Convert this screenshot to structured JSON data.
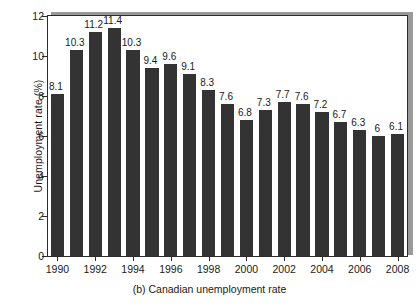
{
  "caption": "(b) Canadian unemployment rate",
  "axes": {
    "ylabel": "Unemployment rate (%)",
    "yticks": [
      "0",
      "2",
      "4",
      "6",
      "8",
      "10",
      "12"
    ],
    "xticks": [
      "1990",
      "1992",
      "1994",
      "1996",
      "1998",
      "2000",
      "2002",
      "2004",
      "2006",
      "2008"
    ]
  },
  "colors": {
    "bar": "#333333",
    "axis": "#2b2b2b",
    "shadow": "#9a9a9a",
    "background": "#ffffff"
  },
  "chart_data": {
    "type": "bar",
    "title": "(b) Canadian unemployment rate",
    "xlabel": "",
    "ylabel": "Unemployment rate (%)",
    "ylim": [
      0,
      12
    ],
    "ytick_step": 2,
    "grid": false,
    "legend": null,
    "categories": [
      "1990",
      "1991",
      "1992",
      "1993",
      "1994",
      "1995",
      "1996",
      "1997",
      "1998",
      "1999",
      "2000",
      "2001",
      "2002",
      "2003",
      "2004",
      "2005",
      "2006",
      "2007",
      "2008"
    ],
    "values": [
      8.1,
      10.3,
      11.2,
      11.4,
      10.3,
      9.4,
      9.6,
      9.1,
      8.3,
      7.6,
      6.8,
      7.3,
      7.7,
      7.6,
      7.2,
      6.7,
      6.3,
      6,
      6.1
    ],
    "data_labels": [
      "8.1",
      "10.3",
      "11.2",
      "11.4",
      "10.3",
      "9.4",
      "9.6",
      "9.1",
      "8.3",
      "7.6",
      "6.8",
      "7.3",
      "7.7",
      "7.6",
      "7.2",
      "6.7",
      "6.3",
      "6",
      "6.1"
    ],
    "xtick_labels": [
      "1990",
      "1992",
      "1994",
      "1996",
      "1998",
      "2000",
      "2002",
      "2004",
      "2006",
      "2008"
    ],
    "xtick_categories": [
      "1990",
      "1992",
      "1994",
      "1996",
      "1998",
      "2000",
      "2002",
      "2004",
      "2006",
      "2008"
    ]
  }
}
